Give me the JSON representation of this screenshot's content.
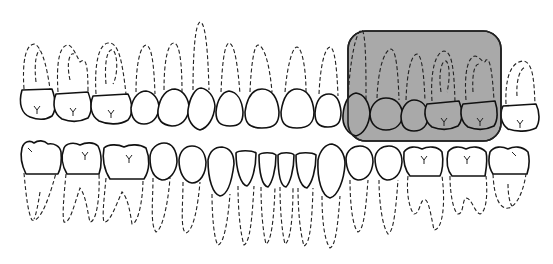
{
  "diagram": {
    "arches": [
      {
        "name": "maxillary",
        "tooth_count": 16,
        "position": "upper"
      },
      {
        "name": "mandibular",
        "tooth_count": 16,
        "position": "lower"
      }
    ],
    "highlight": {
      "shape": "rounded-rectangle",
      "fill": "#a9a9a9",
      "stroke": "#222222",
      "region": "maxillary right-side posterior teeth (premolars and molars)",
      "covers_teeth": 4
    },
    "legend": {
      "crown_line": "solid",
      "root_line": "dashed"
    },
    "colors": {
      "background": "#ffffff",
      "outline": "#111111",
      "shade": "#a9a9a9"
    }
  }
}
